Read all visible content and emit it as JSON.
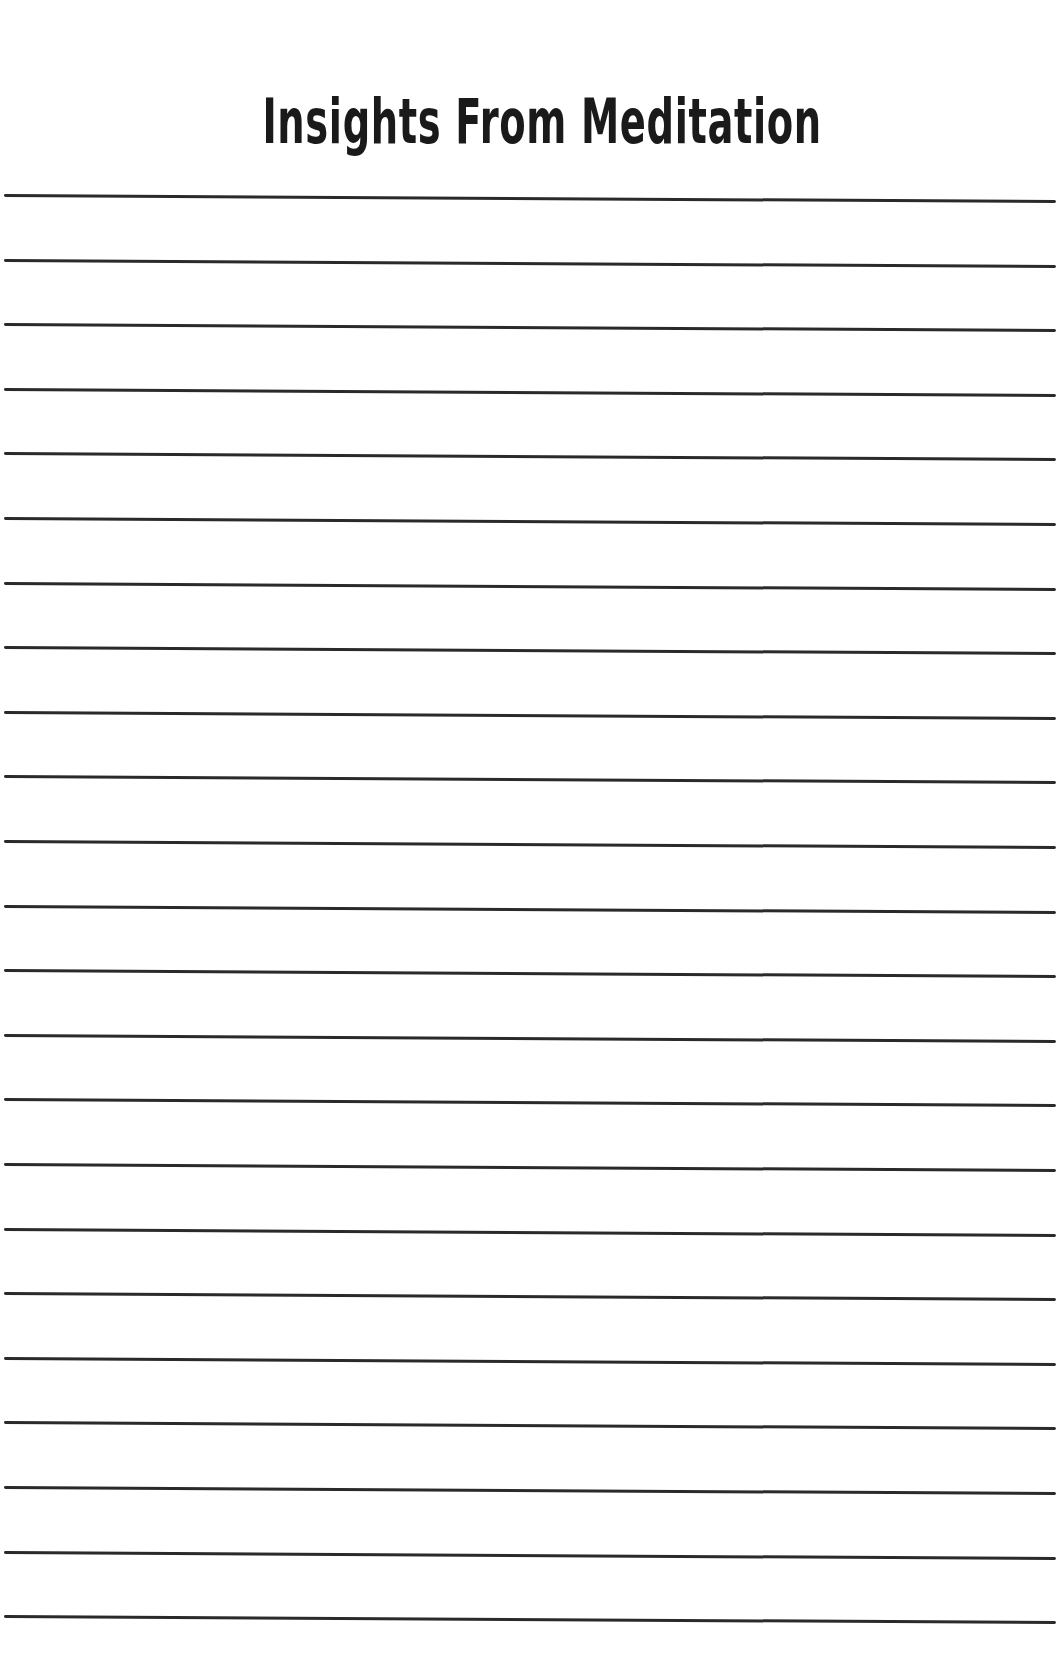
{
  "page": {
    "title": "Insights From Meditation",
    "line_count": 23,
    "colors": {
      "background": "#ffffff",
      "text": "#1a1a1a",
      "rule": "#2a2a2a"
    }
  }
}
